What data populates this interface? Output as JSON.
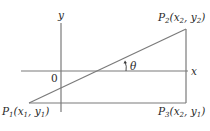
{
  "diagram": {
    "type": "coordinate-geometry",
    "axes": {
      "x_label": "x",
      "y_label": "y",
      "origin_label": "0"
    },
    "points": [
      {
        "id": "P1",
        "name": "P",
        "sub": "1",
        "coords": "(x1, y1)",
        "x_var": "x",
        "x_sub": "1",
        "y_var": "y",
        "y_sub": "1"
      },
      {
        "id": "P2",
        "name": "P",
        "sub": "2",
        "coords": "(x2, y2)",
        "x_var": "x",
        "x_sub": "2",
        "y_var": "y",
        "y_sub": "2"
      },
      {
        "id": "P3",
        "name": "P",
        "sub": "3",
        "coords": "(x2, y1)",
        "x_var": "x",
        "x_sub": "2",
        "y_var": "y",
        "y_sub": "1"
      }
    ],
    "angle_label": "θ",
    "colors": {
      "lines": "#7a7a7a",
      "text": "#2a2a2a"
    }
  }
}
